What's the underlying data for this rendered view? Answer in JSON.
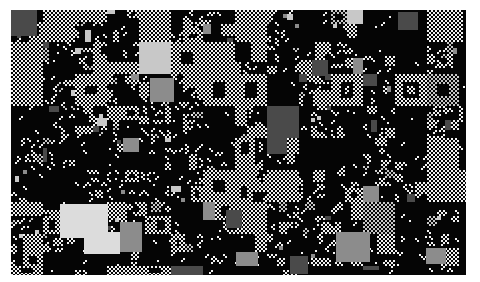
{
  "artwork": {
    "title": "Recursive Quadtree Checkerboard Composition",
    "medium": "generative-raster",
    "canvas": {
      "image_width": 480,
      "image_height": 282,
      "background_color": "#ffffff"
    },
    "plate": {
      "offset_x": 11,
      "offset_y": 10,
      "width": 455,
      "height": 265,
      "base_color": "#050505",
      "description": "dark rectangular plate inset within white page margins, cropped at bottom edge"
    },
    "palette": {
      "black": "#050505",
      "near_black": "#0d0d0d",
      "dark_gray": "#4a4a4a",
      "mid_gray": "#8c8c8c",
      "light_gray": "#c8c8c8",
      "pale_gray": "#dcdcdc",
      "white": "#f2f2f2"
    },
    "pattern": {
      "type": "quadtree-subdivision",
      "base_cell_px": 2,
      "grid_unit_px": 16,
      "max_depth": 4,
      "texture": "fine checkerboard of alternating light and dark 2px cells",
      "fill_probability": 0.5,
      "solid_block_probability": 0.06,
      "nested_hole_probability": 0.45
    },
    "seed": 20240517,
    "solid_accent_blocks": [
      {
        "x": 11,
        "y": 10,
        "w": 26,
        "h": 26,
        "tone": "dark_gray"
      },
      {
        "x": 150,
        "y": 78,
        "w": 24,
        "h": 24,
        "tone": "mid_gray"
      },
      {
        "x": 398,
        "y": 12,
        "w": 20,
        "h": 18,
        "tone": "dark_gray"
      },
      {
        "x": 60,
        "y": 204,
        "w": 48,
        "h": 34,
        "tone": "pale_gray"
      },
      {
        "x": 84,
        "y": 232,
        "w": 36,
        "h": 22,
        "tone": "pale_gray"
      },
      {
        "x": 120,
        "y": 222,
        "w": 22,
        "h": 30,
        "tone": "mid_gray"
      },
      {
        "x": 226,
        "y": 210,
        "w": 16,
        "h": 18,
        "tone": "dark_gray"
      },
      {
        "x": 336,
        "y": 232,
        "w": 34,
        "h": 30,
        "tone": "mid_gray"
      },
      {
        "x": 290,
        "y": 256,
        "w": 18,
        "h": 18,
        "tone": "dark_gray"
      },
      {
        "x": 426,
        "y": 248,
        "w": 20,
        "h": 16,
        "tone": "mid_gray"
      },
      {
        "x": 236,
        "y": 252,
        "w": 22,
        "h": 14,
        "tone": "mid_gray"
      },
      {
        "x": 312,
        "y": 60,
        "w": 16,
        "h": 16,
        "tone": "dark_gray"
      }
    ],
    "stats": {
      "block_count_estimate": 420,
      "distinct_tones": 7
    }
  }
}
